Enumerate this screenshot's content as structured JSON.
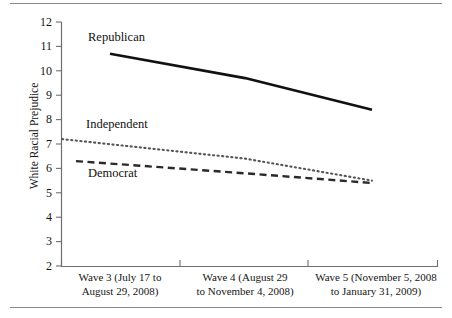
{
  "figure": {
    "background": "#ffffff",
    "rule_color": "#8a8a8a"
  },
  "chart_data": {
    "type": "line",
    "title": "",
    "xlabel": "",
    "ylabel": "White Racial Prejudice",
    "ylim": [
      2,
      12
    ],
    "yticks": [
      12,
      11,
      10,
      9,
      8,
      7,
      6,
      5,
      4,
      3,
      2
    ],
    "grid": false,
    "legend": "inline-labels",
    "categories": [
      "Wave 3 (July 17 to August 29, 2008)",
      "Wave 4 (August 29 to November 4, 2008)",
      "Wave 5 (November 5, 2008 to January 31, 2009)"
    ],
    "category_lines": [
      [
        "Wave 3 (July 17 to",
        "August 29, 2008)"
      ],
      [
        "Wave 4 (August 29",
        "to November 4, 2008)"
      ],
      [
        "Wave 5 (November 5, 2008",
        "to January 31, 2009)"
      ]
    ],
    "series": [
      {
        "name": "Republican",
        "style": "solid",
        "color": "#111111",
        "values": [
          10.7,
          9.7,
          8.4
        ]
      },
      {
        "name": "Independent",
        "style": "dotted",
        "color": "#555555",
        "values": [
          7.2,
          6.4,
          5.5
        ]
      },
      {
        "name": "Democrat",
        "style": "dashed",
        "color": "#2a2a2a",
        "values": [
          6.3,
          5.8,
          5.4
        ]
      }
    ]
  },
  "axis": {
    "y_tick_labels": [
      "12",
      "11",
      "10",
      "9",
      "8",
      "7",
      "6",
      "5",
      "4",
      "3",
      "2"
    ],
    "y_axis_title": "White Racial Prejudice"
  },
  "series_labels": {
    "republican": "Republican",
    "independent": "Independent",
    "democrat": "Democrat"
  }
}
